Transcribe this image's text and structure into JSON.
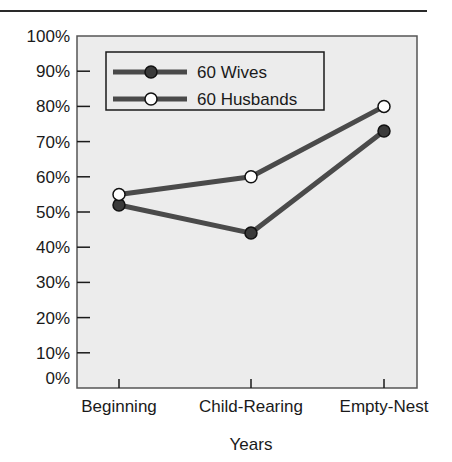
{
  "page": {
    "header_rule": true
  },
  "chart_data": {
    "type": "line",
    "title": "",
    "xlabel": "Years",
    "ylabel": "",
    "categories": [
      "Beginning",
      "Child-Rearing",
      "Empty-Nest"
    ],
    "series": [
      {
        "name": "60 Wives",
        "values": [
          52,
          44,
          73
        ],
        "marker": "filled-circle",
        "marker_color": "#3a3a3a",
        "line_color": "#4a4a4a"
      },
      {
        "name": "60 Husbands",
        "values": [
          55,
          60,
          80
        ],
        "marker": "open-circle",
        "marker_color": "#ffffff",
        "line_color": "#4a4a4a"
      }
    ],
    "ylim": [
      0,
      100
    ],
    "yticks": [
      "0%",
      "10%",
      "20%",
      "30%",
      "40%",
      "50%",
      "60%",
      "70%",
      "80%",
      "90%",
      "100%"
    ],
    "ytick_values": [
      0,
      10,
      20,
      30,
      40,
      50,
      60,
      70,
      80,
      90,
      100
    ],
    "grid": false,
    "legend_position": "upper-left-inside",
    "plot_background": "#ececec"
  }
}
